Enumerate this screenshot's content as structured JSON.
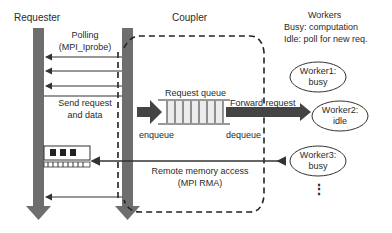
{
  "diagram": {
    "columns": {
      "requester": "Requester",
      "coupler": "Coupler",
      "workers": "Workers"
    },
    "legend": {
      "busy": "Busy: computation",
      "idle": "Idle: poll for new req."
    },
    "labels": {
      "polling": "Polling",
      "polling_api": "(MPI_Iprobe)",
      "send_request": "Send request",
      "and_data": "and data",
      "request_queue": "Request queue",
      "forward_request": "Forward request",
      "enqueue": "enqueue",
      "dequeue": "dequeue",
      "remote_memory": "Remote memory access",
      "remote_memory_api": "(MPI RMA)"
    },
    "workers": [
      {
        "name": "Worker1:",
        "state": "busy"
      },
      {
        "name": "Worker2:",
        "state": "idle"
      },
      {
        "name": "Worker3:",
        "state": "busy"
      }
    ],
    "more": "⋮",
    "colors": {
      "lifeline": "#6e6e6e",
      "arrow": "#444444",
      "queue_fill": "#ececec"
    }
  }
}
